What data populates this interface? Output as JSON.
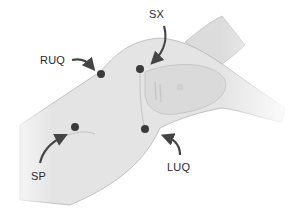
{
  "diagram": {
    "colors": {
      "background": "#ffffff",
      "body_fill": "#e4e4e4",
      "body_shade": "#d2d2d2",
      "outline": "#b4b4b4",
      "dot": "#3a3a3a",
      "arrow": "#444444",
      "text": "#2a2a2a"
    },
    "points": [
      {
        "id": "ruq",
        "label": "RUQ",
        "dot": [
          101,
          74
        ],
        "label_pos": [
          40,
          55
        ]
      },
      {
        "id": "sx",
        "label": "SX",
        "dot": [
          140,
          69
        ],
        "label_pos": [
          149,
          9
        ]
      },
      {
        "id": "sp",
        "label": "SP",
        "dot": [
          75,
          127
        ],
        "label_pos": [
          31,
          171
        ]
      },
      {
        "id": "luq",
        "label": "LUQ",
        "dot": [
          145,
          129
        ],
        "label_pos": [
          167,
          162
        ]
      }
    ]
  }
}
